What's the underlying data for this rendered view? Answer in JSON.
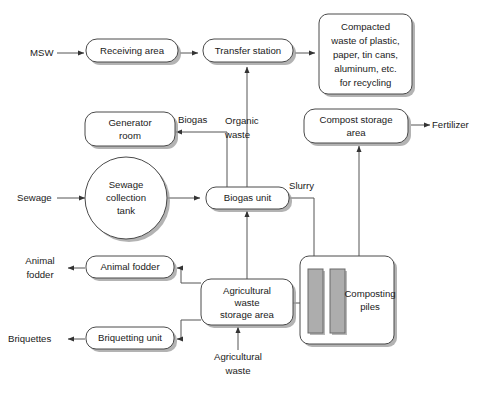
{
  "diagram": {
    "background_color": "#ffffff",
    "node_fill": "#ffffff",
    "node_stroke": "#4a4a4a",
    "shadow_color": "#9a9a9a",
    "connector_color": "#555555",
    "pile_fill": "#adadad",
    "text_color": "#1a1a1a"
  },
  "nodes": {
    "receiving_area": {
      "label": "Receiving area",
      "shape": "rounded-rect"
    },
    "transfer_station": {
      "label": "Transfer station",
      "shape": "rounded-rect"
    },
    "compacted_waste": {
      "shape": "rounded-rect",
      "lines": [
        "Compacted",
        "waste of plastic,",
        "paper, tin cans,",
        "aluminum, etc.",
        "for recycling"
      ]
    },
    "generator_room": {
      "shape": "rounded-rect",
      "lines": [
        "Generator",
        "room"
      ]
    },
    "compost_storage": {
      "shape": "rounded-rect",
      "lines": [
        "Compost storage",
        "area"
      ]
    },
    "sewage_tank": {
      "shape": "circle",
      "lines": [
        "Sewage",
        "collection",
        "tank"
      ]
    },
    "biogas_unit": {
      "label": "Biogas unit",
      "shape": "rounded-rect"
    },
    "animal_fodder_unit": {
      "label": "Animal fodder",
      "shape": "rounded-rect"
    },
    "agri_storage": {
      "shape": "rounded-rect",
      "lines": [
        "Agricultural",
        "waste",
        "storage area"
      ]
    },
    "briquetting_unit": {
      "label": "Briquetting unit",
      "shape": "rounded-rect"
    },
    "composting_piles": {
      "shape": "rounded-rect",
      "lines": [
        "Composting",
        "piles"
      ],
      "pile_count": 2
    }
  },
  "io_labels": {
    "msw": "MSW",
    "sewage": "Sewage",
    "fertilizer": "Fertilizer",
    "animal_fodder_out_line1": "Animal",
    "animal_fodder_out_line2": "fodder",
    "briquettes": "Briquettes",
    "agricultural_waste_line1": "Agricultural",
    "agricultural_waste_line2": "waste"
  },
  "edge_labels": {
    "biogas": "Biogas",
    "organic_waste_line1": "Organic",
    "organic_waste_line2": "waste",
    "slurry": "Slurry"
  }
}
